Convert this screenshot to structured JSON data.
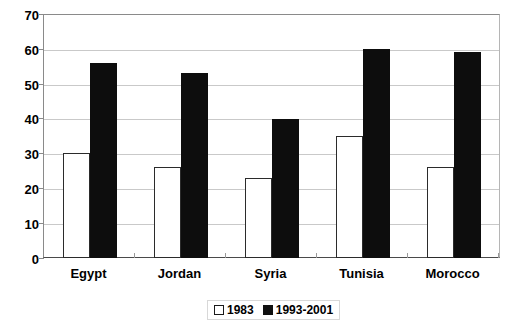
{
  "chart_data": {
    "type": "bar",
    "title": "",
    "subtitle": "",
    "xlabel": "",
    "ylabel": "",
    "categories": [
      "Egypt",
      "Jordan",
      "Syria",
      "Tunisia",
      "Morocco"
    ],
    "series": [
      {
        "name": "1983",
        "values": [
          30,
          26,
          23,
          35,
          26
        ],
        "color": "#ffffff",
        "edge_color": "#000000"
      },
      {
        "name": "1993-2001",
        "values": [
          56,
          53,
          40,
          60,
          59
        ],
        "color": "#000000",
        "edge_color": "#000000"
      }
    ],
    "ylim": [
      0,
      70
    ],
    "yticks": [
      0,
      10,
      20,
      30,
      40,
      50,
      60,
      70
    ],
    "ytick_labels": [
      "0",
      "10",
      "20",
      "30",
      "40",
      "50",
      "60",
      "70"
    ],
    "grid": true,
    "grid_axis": "y",
    "legend_position": "bottom-center",
    "legend_entries": [
      "1983",
      "1993-2001"
    ],
    "bar_style": "grouped-adjacent",
    "background_color": "#ffffff",
    "gridline_color": "#c9c9c9",
    "axis_color": "#4a4a4a"
  }
}
